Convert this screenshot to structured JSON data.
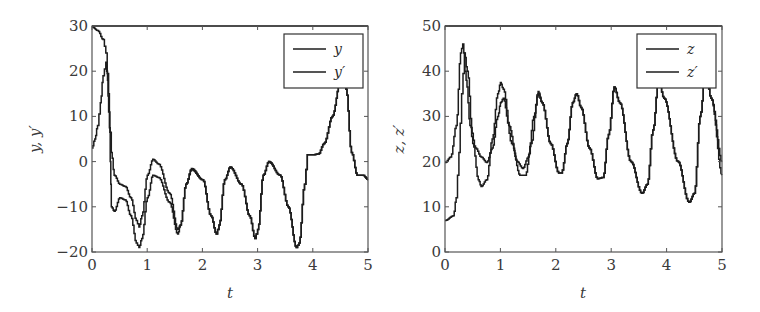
{
  "chart_data": [
    {
      "type": "line",
      "title": "",
      "xlabel": "t",
      "ylabel": "y, y′",
      "xlim": [
        0,
        5
      ],
      "ylim": [
        -20,
        30
      ],
      "xticks": [
        "0",
        "1",
        "2",
        "3",
        "4",
        "5"
      ],
      "yticks": [
        "30",
        "20",
        "10",
        "0",
        "−10",
        "−20"
      ],
      "grid": false,
      "legend_position": "upper right",
      "series": [
        {
          "name": "y",
          "x": [
            0,
            0.1,
            0.2,
            0.25,
            0.3,
            0.33,
            0.35,
            0.4,
            0.5,
            0.6,
            0.7,
            0.8,
            0.85,
            0.9,
            1.0,
            1.1,
            1.2,
            1.4,
            1.55,
            1.6,
            1.7,
            1.8,
            2.0,
            2.15,
            2.25,
            2.3,
            2.4,
            2.5,
            2.7,
            2.85,
            2.95,
            3.0,
            3.1,
            3.2,
            3.4,
            3.55,
            3.7,
            3.75,
            3.85,
            3.9,
            4.0,
            4.1,
            4.2,
            4.35,
            4.5,
            4.55,
            4.6,
            4.7,
            4.8,
            4.9,
            5.0
          ],
          "values": [
            29.8,
            29,
            27,
            24,
            15,
            0,
            -10,
            -11,
            -8,
            -8.5,
            -12,
            -18,
            -19,
            -17,
            -8,
            -3,
            -3.5,
            -9,
            -16,
            -14,
            -5,
            -1.5,
            -4,
            -12,
            -16,
            -14,
            -4,
            -1.2,
            -5,
            -12,
            -17,
            -15,
            -3,
            0,
            -3,
            -10,
            -19,
            -18,
            -5,
            1.5,
            1.5,
            1.7,
            4,
            10,
            18,
            20,
            16,
            2,
            -3,
            -3,
            -4
          ]
        },
        {
          "name": "y′",
          "x": [
            0,
            0.05,
            0.1,
            0.15,
            0.2,
            0.25,
            0.28,
            0.3,
            0.35,
            0.4,
            0.5,
            0.6,
            0.7,
            0.8,
            0.85,
            0.9,
            1.0,
            1.1,
            1.2,
            1.4,
            1.55,
            1.6,
            1.7,
            1.8,
            2.0,
            2.15,
            2.25,
            2.3,
            2.4,
            2.5,
            2.7,
            2.85,
            2.95,
            3.0,
            3.1,
            3.2,
            3.4,
            3.55,
            3.7,
            3.75,
            3.85,
            3.9,
            4.0,
            4.1,
            4.2,
            4.35,
            4.5,
            4.55,
            4.6,
            4.7,
            4.8,
            4.9,
            5.0
          ],
          "values": [
            3,
            5,
            8,
            13,
            19,
            22,
            18,
            11,
            2,
            -3,
            -5,
            -5.5,
            -8,
            -13,
            -14.5,
            -12,
            -3,
            0.5,
            -0.5,
            -7,
            -15,
            -14,
            -5,
            -1.8,
            -4,
            -12,
            -16,
            -14,
            -4,
            -1.2,
            -5,
            -12,
            -17,
            -15,
            -3,
            0,
            -3,
            -10,
            -19,
            -18,
            -5,
            1.5,
            1.5,
            1.7,
            4,
            10,
            18,
            20,
            16,
            2,
            -3,
            -3,
            -4
          ]
        }
      ]
    },
    {
      "type": "line",
      "title": "",
      "xlabel": "t",
      "ylabel": "z, z′",
      "xlim": [
        0,
        5
      ],
      "ylim": [
        0,
        50
      ],
      "xticks": [
        "0",
        "1",
        "2",
        "3",
        "4",
        "5"
      ],
      "yticks": [
        "50",
        "40",
        "30",
        "20",
        "10",
        "0"
      ],
      "grid": false,
      "legend_position": "upper right",
      "series": [
        {
          "name": "z",
          "x": [
            0,
            0.1,
            0.2,
            0.28,
            0.32,
            0.38,
            0.45,
            0.55,
            0.65,
            0.75,
            0.85,
            0.95,
            1.0,
            1.05,
            1.15,
            1.3,
            1.4,
            1.5,
            1.6,
            1.68,
            1.75,
            1.9,
            2.05,
            2.1,
            2.2,
            2.3,
            2.37,
            2.45,
            2.6,
            2.75,
            2.85,
            2.95,
            3.05,
            3.15,
            3.35,
            3.55,
            3.65,
            3.75,
            3.85,
            3.95,
            4.2,
            4.4,
            4.5,
            4.6,
            4.7,
            4.8,
            5.0
          ],
          "values": [
            19.8,
            21,
            28,
            44,
            46,
            38,
            28,
            23,
            21,
            19.8,
            23,
            30,
            33,
            34,
            28,
            20,
            18.5,
            21,
            30,
            35,
            33,
            24,
            17.5,
            17.5,
            24,
            33,
            35,
            32,
            23,
            16.2,
            16.5,
            26,
            36.5,
            33,
            20,
            13,
            15,
            27,
            38,
            34,
            20,
            11,
            13,
            30,
            40,
            34,
            20
          ]
        },
        {
          "name": "z′",
          "x": [
            0,
            0.15,
            0.2,
            0.25,
            0.3,
            0.35,
            0.4,
            0.5,
            0.6,
            0.65,
            0.75,
            0.85,
            0.95,
            1.0,
            1.05,
            1.2,
            1.35,
            1.45,
            1.55,
            1.68,
            1.75,
            1.9,
            2.05,
            2.1,
            2.2,
            2.3,
            2.37,
            2.45,
            2.6,
            2.75,
            2.85,
            2.95,
            3.05,
            3.15,
            3.35,
            3.55,
            3.65,
            3.75,
            3.85,
            3.95,
            4.2,
            4.4,
            4.5,
            4.6,
            4.7,
            4.8,
            5.0
          ],
          "values": [
            7,
            8,
            12,
            22,
            35,
            44,
            40,
            24,
            16,
            14.5,
            16,
            25,
            35,
            37.5,
            36,
            24,
            17,
            17,
            24,
            35.5,
            33,
            24,
            17.5,
            17.5,
            24,
            33,
            35,
            32,
            23,
            16.2,
            16.5,
            26,
            36.5,
            33,
            20,
            13,
            15,
            27,
            38,
            34,
            20,
            11,
            13,
            30,
            40,
            34,
            17
          ]
        }
      ]
    }
  ],
  "left_chart": {
    "ylabel": "y, y′",
    "xlabel": "t",
    "legend": [
      "y",
      "y′"
    ]
  },
  "right_chart": {
    "ylabel": "z, z′",
    "xlabel": "t",
    "legend": [
      "z",
      "z′"
    ]
  }
}
